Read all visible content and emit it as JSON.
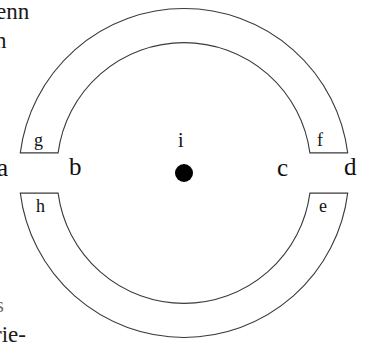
{
  "figure": {
    "type": "annulus-diagram",
    "background_color": "#ffffff",
    "stroke_color": "#3a3a3a",
    "center": {
      "x": 184,
      "y": 173
    },
    "outer_radius": 165,
    "inner_radius": 127,
    "gap_half_angle_degrees": 7,
    "center_dot": {
      "label": "i",
      "radius": 9,
      "fill": "#000000"
    },
    "axis_labels": [
      {
        "id": "a",
        "text": "a",
        "x": 0,
        "y": 160
      },
      {
        "id": "b",
        "text": "b",
        "x": 70,
        "y": 159
      },
      {
        "id": "c",
        "text": "c",
        "x": 278,
        "y": 161
      },
      {
        "id": "d",
        "text": "d",
        "x": 344,
        "y": 159
      }
    ],
    "segment_labels": [
      {
        "id": "g",
        "text": "g",
        "x": 34,
        "y": 133,
        "segment": "outer-upper-left"
      },
      {
        "id": "f",
        "text": "f",
        "x": 316,
        "y": 133,
        "segment": "outer-upper-right"
      },
      {
        "id": "h",
        "text": "h",
        "x": 36,
        "y": 199,
        "segment": "outer-lower-left"
      },
      {
        "id": "e",
        "text": "e",
        "x": 318,
        "y": 199,
        "segment": "outer-lower-right"
      }
    ],
    "center_label": {
      "text": "i",
      "x": 178,
      "y": 136
    }
  },
  "margin_text": {
    "top_left_line_1": "enn",
    "top_left_line_2": "n",
    "bottom_left_line_1": "s",
    "bottom_left_line_2": "rie-"
  }
}
